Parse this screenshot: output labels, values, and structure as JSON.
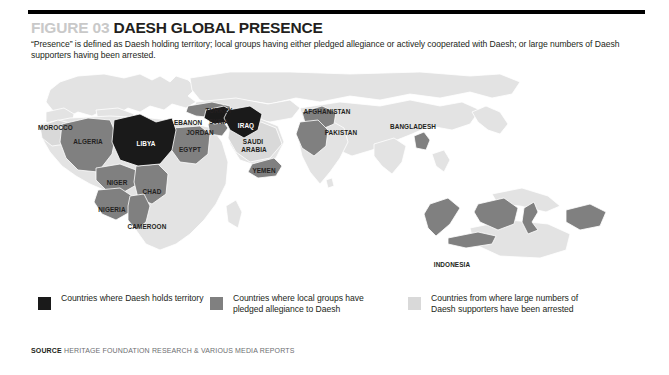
{
  "figure": {
    "number_label": "FIGURE 03",
    "title": "DAESH GLOBAL PRESENCE",
    "subtitle": "“Presence” is defined as Daesh holding territory; local groups having either pledged allegiance or actively cooperated with Daesh; or large numbers of Daesh supporters having been arrested."
  },
  "colors": {
    "holds_territory": "#1a1a1a",
    "pledged_allegiance": "#808080",
    "supporters_arrested": "#d9d9d9",
    "map_base": "#e3e3e3",
    "map_border": "#ffffff",
    "rule": "#000000",
    "figure_number": "#c9c9c9",
    "title_text": "#231f20",
    "source_text": "#6d6e71"
  },
  "legend": {
    "items": [
      {
        "swatch_name": "swatch-black",
        "color": "#1a1a1a",
        "label": "Countries where Daesh holds territory"
      },
      {
        "swatch_name": "swatch-mid-gray",
        "color": "#808080",
        "label": "Countries where local groups have pledged allegiance to Daesh"
      },
      {
        "swatch_name": "swatch-light-gray",
        "color": "#d9d9d9",
        "label": "Countries from where large numbers of Daesh supporters have been arrested"
      }
    ]
  },
  "source": {
    "label": "SOURCE",
    "text": "HERITAGE FOUNDATION RESEARCH & VARIOUS MEDIA REPORTS"
  },
  "map": {
    "labels": [
      {
        "name": "MOROCCO",
        "category": "supporters_arrested"
      },
      {
        "name": "ALGERIA",
        "category": "pledged_allegiance"
      },
      {
        "name": "LIBYA",
        "category": "holds_territory"
      },
      {
        "name": "EGYPT",
        "category": "pledged_allegiance"
      },
      {
        "name": "NIGER",
        "category": "pledged_allegiance"
      },
      {
        "name": "CHAD",
        "category": "pledged_allegiance"
      },
      {
        "name": "NIGERIA",
        "category": "pledged_allegiance"
      },
      {
        "name": "CAMEROON",
        "category": "pledged_allegiance"
      },
      {
        "name": "LEBANON",
        "category": "pledged_allegiance"
      },
      {
        "name": "JORDAN",
        "category": "pledged_allegiance"
      },
      {
        "name": "TURKEY",
        "category": "pledged_allegiance"
      },
      {
        "name": "SYRIA",
        "category": "holds_territory"
      },
      {
        "name": "IRAQ",
        "category": "holds_territory"
      },
      {
        "name": "SAUDI ARABIA",
        "category": "supporters_arrested"
      },
      {
        "name": "YEMEN",
        "category": "pledged_allegiance"
      },
      {
        "name": "AFGHANISTAN",
        "category": "pledged_allegiance"
      },
      {
        "name": "PAKISTAN",
        "category": "pledged_allegiance"
      },
      {
        "name": "BANGLADESH",
        "category": "pledged_allegiance"
      },
      {
        "name": "INDONESIA",
        "category": "pledged_allegiance"
      }
    ]
  }
}
